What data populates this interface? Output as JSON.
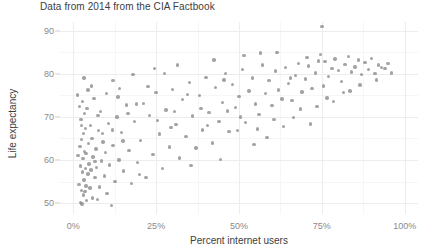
{
  "chart_data": {
    "type": "scatter",
    "title": "Data from 2014 from the CIA Factbook",
    "xlabel": "Percent internet users",
    "ylabel": "Life expectancy",
    "xlim": [
      -4,
      104
    ],
    "ylim": [
      47.5,
      92
    ],
    "xticks": [
      0,
      25,
      50,
      75,
      100
    ],
    "xticklabels": [
      "0%",
      "25%",
      "50%",
      "75%",
      "100%"
    ],
    "yticks": [
      50,
      60,
      70,
      80,
      90
    ],
    "yticklabels": [
      "50",
      "60",
      "70",
      "80",
      "90"
    ],
    "x_minor_ticks": [
      12.5,
      37.5,
      62.5,
      87.5
    ],
    "y_minor_ticks": [
      55,
      65,
      75,
      85
    ],
    "grid": true,
    "legend": "none",
    "marker_color": "#7f7f7f",
    "marker_opacity": 0.72,
    "marker_size_px": 3.4,
    "background": "#ffffff",
    "gridline_color": "#ededed",
    "n_points": 185,
    "points": [
      [
        1.2,
        75.1
      ],
      [
        1.4,
        61.0
      ],
      [
        1.7,
        54.3
      ],
      [
        1.9,
        72.4
      ],
      [
        2.0,
        63.2
      ],
      [
        2.1,
        50.1
      ],
      [
        2.2,
        58.6
      ],
      [
        2.3,
        69.4
      ],
      [
        2.4,
        53.0
      ],
      [
        2.5,
        64.8
      ],
      [
        2.6,
        49.8
      ],
      [
        2.7,
        57.2
      ],
      [
        2.8,
        73.6
      ],
      [
        2.9,
        60.3
      ],
      [
        3.0,
        51.9
      ],
      [
        3.1,
        66.1
      ],
      [
        3.2,
        55.4
      ],
      [
        3.3,
        62.0
      ],
      [
        3.4,
        70.8
      ],
      [
        3.5,
        52.7
      ],
      [
        3.6,
        58.0
      ],
      [
        3.7,
        67.3
      ],
      [
        3.8,
        54.0
      ],
      [
        3.9,
        61.5
      ],
      [
        4.0,
        50.6
      ],
      [
        4.2,
        72.0
      ],
      [
        4.4,
        56.8
      ],
      [
        4.6,
        63.9
      ],
      [
        4.8,
        59.1
      ],
      [
        5.0,
        53.5
      ],
      [
        5.2,
        68.0
      ],
      [
        5.4,
        57.7
      ],
      [
        5.6,
        65.0
      ],
      [
        5.8,
        51.2
      ],
      [
        6.0,
        60.7
      ],
      [
        6.2,
        74.3
      ],
      [
        6.5,
        55.9
      ],
      [
        6.8,
        62.6
      ],
      [
        7.0,
        58.3
      ],
      [
        7.3,
        50.9
      ],
      [
        7.6,
        66.8
      ],
      [
        8.0,
        53.8
      ],
      [
        8.3,
        71.2
      ],
      [
        8.6,
        59.8
      ],
      [
        9.0,
        64.2
      ],
      [
        9.4,
        56.3
      ],
      [
        9.8,
        61.8
      ],
      [
        10.2,
        52.2
      ],
      [
        10.6,
        68.5
      ],
      [
        11.0,
        58.9
      ],
      [
        11.5,
        49.5
      ],
      [
        12.0,
        63.4
      ],
      [
        12.6,
        55.0
      ],
      [
        13.2,
        70.0
      ],
      [
        13.8,
        60.0
      ],
      [
        14.5,
        66.4
      ],
      [
        15.2,
        57.5
      ],
      [
        16.0,
        72.8
      ],
      [
        16.8,
        62.2
      ],
      [
        17.6,
        54.6
      ],
      [
        18.5,
        68.9
      ],
      [
        19.4,
        59.4
      ],
      [
        20.3,
        64.6
      ],
      [
        21.2,
        73.1
      ],
      [
        22.0,
        56.0
      ],
      [
        23.0,
        70.4
      ],
      [
        24.0,
        61.3
      ],
      [
        25.0,
        75.6
      ],
      [
        26.0,
        66.0
      ],
      [
        27.0,
        58.1
      ],
      [
        28.0,
        71.6
      ],
      [
        29.0,
        63.0
      ],
      [
        30.0,
        76.4
      ],
      [
        31.0,
        68.2
      ],
      [
        32.0,
        60.5
      ],
      [
        33.0,
        74.0
      ],
      [
        34.0,
        65.5
      ],
      [
        35.0,
        78.0
      ],
      [
        36.0,
        70.2
      ],
      [
        37.0,
        62.8
      ],
      [
        38.0,
        75.0
      ],
      [
        39.0,
        67.0
      ],
      [
        40.0,
        79.2
      ],
      [
        41.0,
        71.0
      ],
      [
        42.0,
        64.0
      ],
      [
        43.0,
        76.8
      ],
      [
        44.0,
        69.0
      ],
      [
        45.0,
        73.4
      ],
      [
        46.0,
        80.1
      ],
      [
        47.0,
        66.6
      ],
      [
        48.0,
        77.5
      ],
      [
        49.0,
        72.2
      ],
      [
        50.0,
        74.8
      ],
      [
        51.0,
        81.0
      ],
      [
        52.0,
        68.7
      ],
      [
        53.0,
        76.0
      ],
      [
        54.0,
        79.0
      ],
      [
        55.0,
        73.0
      ],
      [
        56.0,
        70.6
      ],
      [
        57.0,
        82.0
      ],
      [
        58.0,
        75.4
      ],
      [
        59.0,
        78.4
      ],
      [
        60.0,
        72.6
      ],
      [
        61.0,
        80.6
      ],
      [
        62.0,
        76.2
      ],
      [
        63.0,
        74.2
      ],
      [
        64.0,
        81.4
      ],
      [
        65.0,
        77.8
      ],
      [
        66.0,
        73.8
      ],
      [
        67.0,
        79.6
      ],
      [
        68.0,
        82.4
      ],
      [
        69.0,
        75.8
      ],
      [
        70.0,
        78.8
      ],
      [
        71.0,
        81.8
      ],
      [
        72.0,
        76.6
      ],
      [
        73.0,
        80.2
      ],
      [
        74.0,
        83.0
      ],
      [
        75.0,
        91.0
      ],
      [
        75.5,
        77.2
      ],
      [
        76.0,
        82.8
      ],
      [
        77.0,
        79.4
      ],
      [
        78.0,
        81.2
      ],
      [
        79.0,
        83.4
      ],
      [
        80.0,
        80.8
      ],
      [
        81.0,
        78.2
      ],
      [
        82.0,
        82.2
      ],
      [
        83.0,
        84.0
      ],
      [
        84.0,
        80.4
      ],
      [
        85.0,
        81.6
      ],
      [
        86.0,
        83.2
      ],
      [
        87.0,
        79.8
      ],
      [
        88.0,
        82.6
      ],
      [
        89.0,
        81.0
      ],
      [
        90.0,
        83.6
      ],
      [
        91.0,
        80.0
      ],
      [
        92.0,
        82.0
      ],
      [
        93.0,
        81.4
      ],
      [
        94.0,
        81.2
      ],
      [
        95.0,
        82.4
      ],
      [
        96.0,
        80.2
      ],
      [
        12.0,
        78.4
      ],
      [
        14.0,
        76.6
      ],
      [
        18.0,
        79.8
      ],
      [
        22.5,
        77.0
      ],
      [
        24.5,
        81.2
      ],
      [
        27.5,
        80.0
      ],
      [
        31.5,
        82.0
      ],
      [
        34.5,
        75.2
      ],
      [
        38.5,
        72.0
      ],
      [
        42.5,
        83.2
      ],
      [
        46.5,
        71.4
      ],
      [
        51.5,
        84.2
      ],
      [
        56.5,
        84.8
      ],
      [
        61.5,
        85.0
      ],
      [
        66.5,
        69.8
      ],
      [
        71.5,
        68.4
      ],
      [
        76.5,
        74.4
      ],
      [
        81.5,
        75.6
      ],
      [
        86.5,
        77.4
      ],
      [
        91.5,
        78.6
      ],
      [
        5.5,
        77.2
      ],
      [
        8.8,
        66.2
      ],
      [
        16.5,
        70.8
      ],
      [
        20.0,
        56.6
      ],
      [
        29.5,
        67.6
      ],
      [
        35.5,
        58.8
      ],
      [
        44.5,
        60.2
      ],
      [
        49.5,
        66.8
      ],
      [
        54.5,
        63.6
      ],
      [
        58.5,
        65.2
      ],
      [
        63.5,
        67.8
      ],
      [
        68.5,
        71.8
      ],
      [
        73.5,
        72.4
      ],
      [
        78.5,
        73.6
      ],
      [
        83.5,
        76.0
      ],
      [
        3.2,
        79.0
      ],
      [
        6.6,
        59.6
      ],
      [
        10.0,
        75.4
      ],
      [
        15.0,
        64.4
      ],
      [
        19.0,
        73.0
      ],
      [
        25.5,
        69.2
      ],
      [
        30.5,
        71.2
      ],
      [
        40.5,
        68.0
      ],
      [
        45.5,
        78.6
      ],
      [
        50.5,
        70.0
      ],
      [
        55.5,
        67.2
      ],
      [
        60.5,
        69.4
      ],
      [
        65.5,
        79.0
      ],
      [
        70.5,
        83.8
      ],
      [
        74.5,
        84.4
      ],
      [
        2.5,
        68.0
      ],
      [
        4.5,
        76.2
      ],
      [
        7.5,
        70.4
      ],
      [
        11.8,
        67.0
      ],
      [
        13.5,
        74.6
      ]
    ]
  }
}
